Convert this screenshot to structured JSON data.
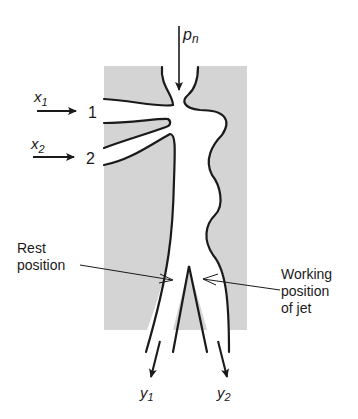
{
  "diagram": {
    "type": "fluidic-jet-switch",
    "colors": {
      "housing": "#d4d4d4",
      "ink": "#1a1a1a",
      "background": "#ffffff"
    },
    "labels": {
      "supply": "p",
      "supply_sub": "n",
      "control1": "x",
      "control1_sub": "1",
      "control2": "x",
      "control2_sub": "2",
      "port1": "1",
      "port2": "2",
      "output1": "y",
      "output1_sub": "1",
      "output2": "y",
      "output2_sub": "2",
      "rest_line1": "Rest",
      "rest_line2": "position",
      "working_line1": "Working",
      "working_line2": "position",
      "working_line3": "of jet"
    }
  }
}
